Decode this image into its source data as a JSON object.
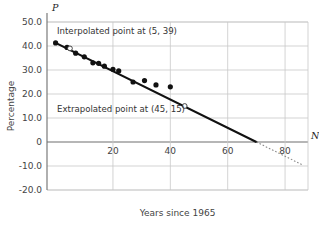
{
  "chart_data": {
    "type": "scatter",
    "title": "",
    "xlabel": "Years since 1965",
    "ylabel": "Percentage",
    "x_axis_letter": "N",
    "y_axis_letter": "P",
    "xlim": [
      -3,
      88
    ],
    "ylim": [
      -20,
      50
    ],
    "grid": true,
    "legend": "none",
    "xticks": [
      20,
      40,
      60,
      80
    ],
    "xtick_labels": [
      "20",
      "40",
      "60",
      "80"
    ],
    "yticks": [
      50,
      40,
      30,
      20,
      10,
      0,
      -10,
      -20
    ],
    "ytick_labels": [
      "50.0",
      "40.0",
      "30.0",
      "20.0",
      "10.0",
      "0",
      "-10.0",
      "-20.0"
    ],
    "series": [
      {
        "name": "observed",
        "marker": "filled-circle",
        "points": [
          {
            "x": 0,
            "y": 41.3
          },
          {
            "x": 4,
            "y": 39.4
          },
          {
            "x": 7,
            "y": 37.0
          },
          {
            "x": 10,
            "y": 35.5
          },
          {
            "x": 13,
            "y": 33.0
          },
          {
            "x": 15,
            "y": 32.8
          },
          {
            "x": 17,
            "y": 31.6
          },
          {
            "x": 20,
            "y": 30.3
          },
          {
            "x": 22,
            "y": 29.6
          },
          {
            "x": 27,
            "y": 25.0
          },
          {
            "x": 31,
            "y": 25.6
          },
          {
            "x": 35,
            "y": 23.8
          },
          {
            "x": 40,
            "y": 23.0
          }
        ]
      },
      {
        "name": "estimated",
        "marker": "open-circle",
        "points": [
          {
            "x": 5,
            "y": 39.0,
            "kind": "interpolated"
          },
          {
            "x": 45,
            "y": 15.0,
            "kind": "extrapolated"
          }
        ]
      }
    ],
    "trend_line": {
      "style": "solid",
      "from": {
        "x": 0,
        "y": 41.3
      },
      "to": {
        "x": 70,
        "y": 0
      }
    },
    "trend_line_extension": {
      "style": "dotted",
      "from": {
        "x": 70,
        "y": 0
      },
      "to": {
        "x": 86,
        "y": -9.5
      }
    },
    "annotations": [
      {
        "name": "interpolated-label",
        "text": "Interpolated point at (5, 39)",
        "x": 57,
        "y": 34
      },
      {
        "name": "extrapolated-label",
        "text": "Extrapolated point at (45, 15)",
        "x": 57,
        "y": 112
      }
    ]
  }
}
